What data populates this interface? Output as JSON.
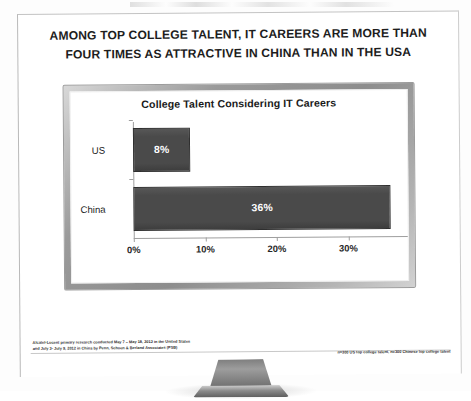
{
  "slide": {
    "headline_line1": "AMONG TOP COLLEGE TALENT, IT CAREERS ARE MORE THAN",
    "headline_line2": "FOUR TIMES AS ATTRACTIVE IN CHINA THAN IN THE USA",
    "footnote_line1": "Alcatel-Lucent primary research conducted May 7 – May 18, 2012 in the United States",
    "footnote_line2": "and July 3- July 9, 2012 in China by Penn, Schoen & Berland Associates (PSB)",
    "footnote_right": "n=300 US top college talent, n=300 Chinese top college talent"
  },
  "device": {
    "type": "desktop-monitor",
    "bezel_color": "#9a9a9a",
    "screen_color": "#ffffff"
  },
  "chart_data": {
    "type": "bar",
    "orientation": "horizontal",
    "title": "College Talent Considering IT Careers",
    "categories": [
      "US",
      "China"
    ],
    "values": [
      8,
      36
    ],
    "data_labels": [
      "8%",
      "36%"
    ],
    "xlabel": "",
    "ylabel": "",
    "xlim": [
      0,
      40
    ],
    "xticks": [
      0,
      10,
      20,
      30,
      40
    ],
    "xtick_labels": [
      "0%",
      "10%",
      "20%",
      "30%",
      "40%"
    ],
    "grid": false,
    "legend": false,
    "bar_color": "#4a4a4a",
    "bar_border_color": "#2f2f2f",
    "data_label_color": "#ffffff"
  }
}
